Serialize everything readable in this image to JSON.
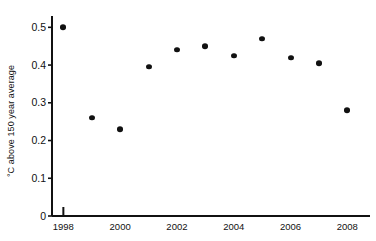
{
  "chart_data": {
    "type": "scatter",
    "title": "",
    "xlabel": "",
    "ylabel": "°C above 150 year average",
    "x": [
      1998,
      1999,
      2000,
      2001,
      2002,
      2003,
      2004,
      2005,
      2006,
      2007,
      2008
    ],
    "values": [
      0.5,
      0.26,
      0.23,
      0.395,
      0.44,
      0.45,
      0.425,
      0.47,
      0.42,
      0.405,
      0.28
    ],
    "series": [
      {
        "name": "Global temperature anomaly",
        "values": [
          0.5,
          0.26,
          0.23,
          0.395,
          0.44,
          0.45,
          0.425,
          0.47,
          0.42,
          0.405,
          0.28
        ]
      }
    ],
    "xlim": [
      1997.6,
      2008.8
    ],
    "ylim": [
      0,
      0.53
    ],
    "ytick_values": [
      0,
      0.1,
      0.2,
      0.3,
      0.4,
      0.5
    ],
    "ytick_labels": [
      "0",
      "0.1",
      "0.2",
      "0.3",
      "0.4",
      "0.5"
    ],
    "xtick_values": [
      1998,
      2000,
      2002,
      2004,
      2006,
      2008
    ],
    "xtick_labels": [
      "1998",
      "2000",
      "2002",
      "2004",
      "2006",
      "2008"
    ],
    "grid": false,
    "legend": null,
    "marker": "filled-circle",
    "marker_color": "#111111",
    "axis_color": "#111111",
    "background": "#ffffff"
  }
}
